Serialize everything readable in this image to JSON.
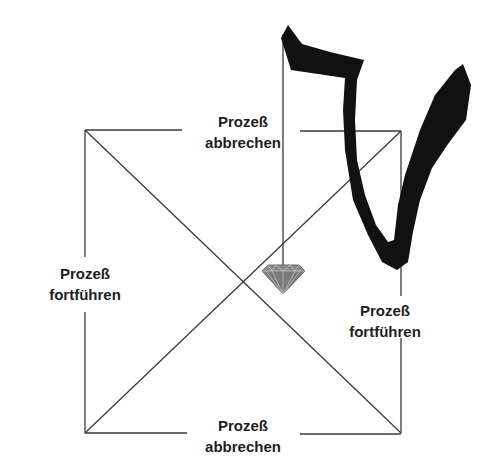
{
  "diagram": {
    "labels": {
      "top": {
        "line1": "Prozeß",
        "line2": "abbrechen"
      },
      "left": {
        "line1": "Prozeß",
        "line2": "fortführen"
      },
      "right": {
        "line1": "Prozeß",
        "line2": "fortführen"
      },
      "bottom": {
        "line1": "Prozeß",
        "line2": "abbrechen"
      }
    },
    "symbols": {
      "brush_stroke": "brush-stroke-glyph",
      "gem": "diamond-icon"
    },
    "colors": {
      "line": "#3a3a3a",
      "stroke_fill": "#111111",
      "gem": "#8a8a8a",
      "text": "#1e1e1e"
    }
  }
}
